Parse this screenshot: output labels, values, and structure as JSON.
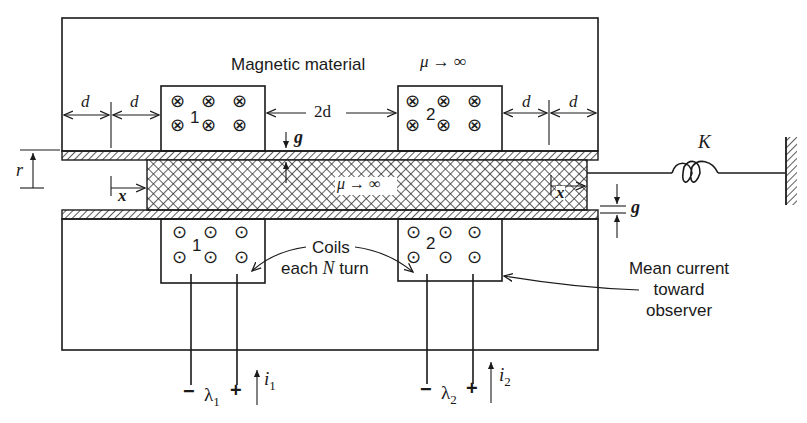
{
  "figure": {
    "title": "Magnetic material",
    "core_permeability": "μ → ∞",
    "plunger_permeability": "μ → ∞",
    "dimensions": {
      "d_left_1": "d",
      "d_left_2": "d",
      "coil_spacing": "2d",
      "d_right_1": "d",
      "d_right_2": "d",
      "gap_top": "g",
      "gap_right": "g",
      "radius": "r",
      "displacement_left": "x",
      "displacement_right": "x"
    },
    "spring": {
      "label": "K"
    },
    "coils": [
      {
        "id": "1",
        "label": "1",
        "lambda": "λ1",
        "lambda_base": "λ",
        "lambda_sub": "1",
        "current": "i",
        "current_sub": "1",
        "minus": "−",
        "plus": "+"
      },
      {
        "id": "2",
        "label": "2",
        "lambda": "λ2",
        "lambda_base": "λ",
        "lambda_sub": "2",
        "current": "i",
        "current_sub": "2",
        "minus": "−",
        "plus": "+"
      }
    ],
    "annotations": {
      "coils_line1": "Coils",
      "coils_line2_prefix": "each ",
      "coils_line2_var": "N",
      "coils_line2_suffix": " turn",
      "mean_current_line1": "Mean current",
      "mean_current_line2": "toward",
      "mean_current_line3": "observer"
    },
    "symbols": {
      "into_page": "⊗",
      "out_of_page": "⊙"
    }
  }
}
